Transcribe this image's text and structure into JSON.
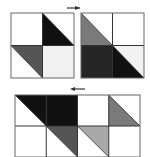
{
  "diagram": {
    "arrows": [
      {
        "id": "arrow-top",
        "direction": "right"
      },
      {
        "id": "arrow-bottom",
        "direction": "left"
      }
    ],
    "colors": {
      "white": "#ffffff",
      "light": "#f1f1f1",
      "lightgray": "#a9a9a9",
      "gray": "#7a7a7a",
      "darkgray": "#555555",
      "dark": "#262626",
      "black": "#111111",
      "line": "#333333"
    },
    "tiles": [
      {
        "name": "tile-a",
        "cols": 2,
        "rows": 2,
        "cells": [
          {
            "fill": "white",
            "triangle": null
          },
          {
            "fill": "white",
            "triangle": {
              "corner": "bottom-left",
              "color": "black"
            }
          },
          {
            "fill": "white",
            "triangle": {
              "corner": "top-right",
              "color": "darkgray"
            }
          },
          {
            "fill": "light",
            "triangle": null
          }
        ]
      },
      {
        "name": "tile-b",
        "cols": 2,
        "rows": 2,
        "cells": [
          {
            "fill": "white",
            "triangle": {
              "corner": "bottom-left",
              "color": "gray"
            }
          },
          {
            "fill": "white",
            "triangle": null
          },
          {
            "fill": "dark",
            "triangle": null
          },
          {
            "fill": "light",
            "triangle": {
              "corner": "bottom-left",
              "color": "black"
            }
          }
        ]
      },
      {
        "name": "tile-combined",
        "cols": 4,
        "rows": 2,
        "cells": [
          {
            "fill": "white",
            "triangle": {
              "corner": "top-right",
              "color": "black"
            }
          },
          {
            "fill": "black",
            "triangle": null
          },
          {
            "fill": "white",
            "triangle": null
          },
          {
            "fill": "white",
            "triangle": {
              "corner": "bottom-left",
              "color": "gray"
            }
          },
          {
            "fill": "white",
            "triangle": null
          },
          {
            "fill": "white",
            "triangle": {
              "corner": "top-right",
              "color": "darkgray"
            }
          },
          {
            "fill": "white",
            "triangle": {
              "corner": "top-right",
              "color": "lightgray"
            }
          },
          {
            "fill": "white",
            "triangle": null
          }
        ]
      }
    ]
  }
}
